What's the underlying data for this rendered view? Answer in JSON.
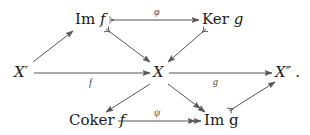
{
  "diagram": {
    "type": "commutative-diagram",
    "nodes": {
      "im_f": {
        "prefix": "Im ",
        "var": "f"
      },
      "ker_g": {
        "prefix": "Ker ",
        "var": "g"
      },
      "x_prime": {
        "var": "X′"
      },
      "x": {
        "var": "X"
      },
      "x_dprime": {
        "var": "X″",
        "suffix": "."
      },
      "coker_f": {
        "prefix": "Coker ",
        "var": "f"
      },
      "im_g": {
        "prefix": "Im ",
        "var": "g"
      }
    },
    "edge_labels": {
      "phi": "φ",
      "f": "f",
      "g": "g",
      "psi": "ψ"
    },
    "edges": [
      {
        "from": "X′",
        "to": "Im f",
        "style": "plain"
      },
      {
        "from": "Im f",
        "to": "Ker g",
        "label": "φ",
        "style": "mono"
      },
      {
        "from": "Im f",
        "to": "X",
        "style": "mono"
      },
      {
        "from": "Ker g",
        "to": "X",
        "style": "mono"
      },
      {
        "from": "X′",
        "to": "X",
        "label": "f",
        "style": "plain"
      },
      {
        "from": "X",
        "to": "X″",
        "label": "g",
        "style": "plain"
      },
      {
        "from": "X",
        "to": "Coker f",
        "style": "plain"
      },
      {
        "from": "X",
        "to": "Im g",
        "style": "epi"
      },
      {
        "from": "Coker f",
        "to": "Im g",
        "label": "ψ",
        "style": "epi"
      },
      {
        "from": "Im g",
        "to": "X″",
        "style": "mono"
      }
    ],
    "colors": {
      "stroke": "#555555",
      "text": "#1a1a1a",
      "label": "#444444"
    }
  }
}
